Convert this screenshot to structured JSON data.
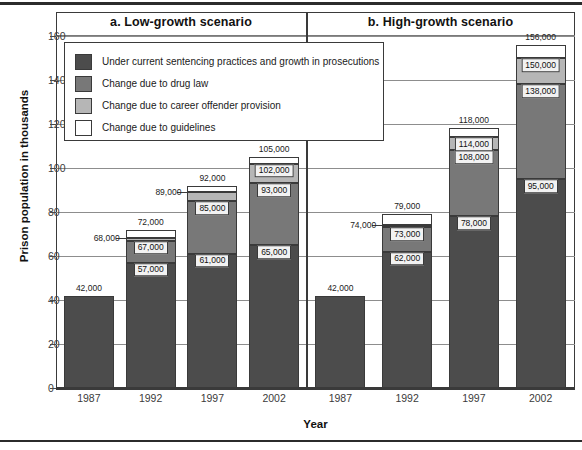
{
  "figure": {
    "ylabel": "Prison population in thousands",
    "xlabel": "Year",
    "panel_a_title": "a. Low-growth scenario",
    "panel_b_title": "b. High-growth scenario"
  },
  "legend": {
    "items": [
      {
        "label": "Under current sentencing practices and growth in prosecutions",
        "color": "#4c4c4c",
        "key": "base"
      },
      {
        "label": "Change due to drug law",
        "color": "#787878",
        "key": "drug_law"
      },
      {
        "label": "Change due to career offender provision",
        "color": "#b6b6b6",
        "key": "career_offender"
      },
      {
        "label": "Change due to guidelines",
        "color": "#ffffff",
        "key": "guidelines"
      }
    ]
  },
  "chart_data": {
    "type": "bar",
    "subtype": "stacked",
    "title": "",
    "xlabel": "Year",
    "ylabel": "Prison population in thousands",
    "ylim": [
      0,
      160
    ],
    "yticks": [
      0,
      20,
      40,
      60,
      80,
      100,
      120,
      140,
      160
    ],
    "grid": true,
    "units": "thousands",
    "legend_position": "inside-top-left",
    "categories": [
      "1987",
      "1992",
      "1997",
      "2002"
    ],
    "series": [
      {
        "name": "Under current sentencing practices and growth in prosecutions",
        "color": "#4c4c4c"
      },
      {
        "name": "Change due to drug law",
        "color": "#787878"
      },
      {
        "name": "Change due to career offender provision",
        "color": "#b6b6b6"
      },
      {
        "name": "Change due to guidelines",
        "color": "#ffffff"
      }
    ],
    "panels": [
      {
        "key": "a",
        "title": "a. Low-growth scenario",
        "bars": [
          {
            "year": "1987",
            "cumulative": [
              42,
              42,
              42,
              42
            ],
            "total_label": "42,000",
            "labels": [
              {
                "text": "42,000",
                "value": 42,
                "style": "top"
              }
            ]
          },
          {
            "year": "1992",
            "cumulative": [
              57,
              67,
              68,
              72
            ],
            "total_label": "72,000",
            "labels": [
              {
                "text": "57,000",
                "value": 57,
                "style": "chip"
              },
              {
                "text": "67,000",
                "value": 67,
                "style": "chip"
              },
              {
                "text": "68,000",
                "value": 68,
                "style": "side"
              },
              {
                "text": "72,000",
                "value": 72,
                "style": "top"
              }
            ]
          },
          {
            "year": "1997",
            "cumulative": [
              61,
              85,
              89,
              92
            ],
            "total_label": "92,000",
            "labels": [
              {
                "text": "61,000",
                "value": 61,
                "style": "chip"
              },
              {
                "text": "85,000",
                "value": 85,
                "style": "chip"
              },
              {
                "text": "89,000",
                "value": 89,
                "style": "side"
              },
              {
                "text": "92,000",
                "value": 92,
                "style": "top"
              }
            ]
          },
          {
            "year": "2002",
            "cumulative": [
              65,
              93,
              102,
              105
            ],
            "total_label": "105,000",
            "labels": [
              {
                "text": "65,000",
                "value": 65,
                "style": "chip"
              },
              {
                "text": "93,000",
                "value": 93,
                "style": "chip"
              },
              {
                "text": "102,000",
                "value": 102,
                "style": "chip"
              },
              {
                "text": "105,000",
                "value": 105,
                "style": "top"
              }
            ]
          }
        ]
      },
      {
        "key": "b",
        "title": "b. High-growth scenario",
        "bars": [
          {
            "year": "1987",
            "cumulative": [
              42,
              42,
              42,
              42
            ],
            "total_label": "42,000",
            "labels": [
              {
                "text": "42,000",
                "value": 42,
                "style": "top"
              }
            ]
          },
          {
            "year": "1992",
            "cumulative": [
              62,
              73,
              74,
              79
            ],
            "total_label": "79,000",
            "labels": [
              {
                "text": "62,000",
                "value": 62,
                "style": "chip"
              },
              {
                "text": "73,000",
                "value": 73,
                "style": "chip"
              },
              {
                "text": "74,000",
                "value": 74,
                "style": "side"
              },
              {
                "text": "79,000",
                "value": 79,
                "style": "top"
              }
            ]
          },
          {
            "year": "1997",
            "cumulative": [
              78,
              108,
              114,
              118
            ],
            "total_label": "118,000",
            "labels": [
              {
                "text": "78,000",
                "value": 78,
                "style": "chip"
              },
              {
                "text": "108,000",
                "value": 108,
                "style": "chip"
              },
              {
                "text": "114,000",
                "value": 114,
                "style": "chip"
              },
              {
                "text": "118,000",
                "value": 118,
                "style": "top"
              }
            ]
          },
          {
            "year": "2002",
            "cumulative": [
              95,
              138,
              150,
              156
            ],
            "total_label": "156,000",
            "labels": [
              {
                "text": "95,000",
                "value": 95,
                "style": "chip"
              },
              {
                "text": "138,000",
                "value": 138,
                "style": "chip"
              },
              {
                "text": "150,000",
                "value": 150,
                "style": "chip"
              },
              {
                "text": "156,000",
                "value": 156,
                "style": "top"
              }
            ]
          }
        ]
      }
    ]
  }
}
